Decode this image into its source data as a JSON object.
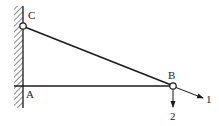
{
  "diagram": {
    "type": "truss-structure",
    "points": {
      "A": {
        "label": "A",
        "x": 22,
        "y": 86
      },
      "B": {
        "label": "B",
        "x": 173,
        "y": 86
      },
      "C": {
        "label": "C",
        "x": 23,
        "y": 26
      }
    },
    "members": [
      {
        "from": "A",
        "to": "B"
      },
      {
        "from": "C",
        "to": "B"
      }
    ],
    "support": {
      "type": "fixed-wall",
      "side": "left"
    },
    "directions": [
      {
        "label": "1",
        "description": "along CB extension"
      },
      {
        "label": "2",
        "description": "vertical downward"
      }
    ],
    "colors": {
      "line": "#1a1a1a",
      "background": "#ffffff"
    }
  }
}
